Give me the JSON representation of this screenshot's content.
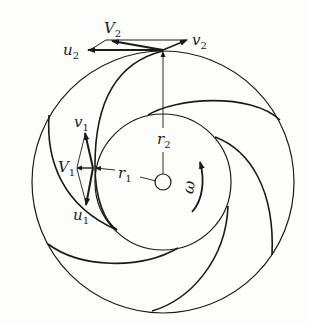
{
  "diagram": {
    "colors": {
      "ink": "#1a1a1a",
      "background": "#fdfdfc"
    },
    "labels": {
      "V2": {
        "main": "V",
        "sub": "2"
      },
      "u2": {
        "main": "u",
        "sub": "2"
      },
      "v2": {
        "main": "v",
        "sub": "2"
      },
      "r2": {
        "main": "r",
        "sub": "2"
      },
      "v1": {
        "main": "v",
        "sub": "1"
      },
      "V1": {
        "main": "V",
        "sub": "1"
      },
      "r1": {
        "main": "r",
        "sub": "1"
      },
      "u1": {
        "main": "u",
        "sub": "1"
      },
      "omega": "ω"
    },
    "elements": {
      "outer_circle": "impeller outer rim (radius r2)",
      "inner_circle": "impeller eye (radius r1)",
      "hub": "shaft hub",
      "blades": 6,
      "rotation_arrow": "counter-clockwise ω"
    }
  }
}
